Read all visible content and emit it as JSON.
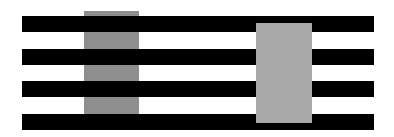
{
  "figure": {
    "type": "White's illusion",
    "background_color": "#ffffff",
    "bar_color": "#000000",
    "bars": [
      {
        "top": 16,
        "height": 16
      },
      {
        "top": 49,
        "height": 16
      },
      {
        "top": 81,
        "height": 16
      },
      {
        "top": 114,
        "height": 16
      }
    ],
    "left_patch": {
      "left": 84,
      "top": 11,
      "width": 55,
      "height": 103,
      "color": "#8e8e8e",
      "layer": "behind-bars"
    },
    "right_patch": {
      "left": 256,
      "top": 23,
      "width": 56,
      "height": 100,
      "color": "#a9a9a9",
      "layer": "over-bars"
    }
  }
}
